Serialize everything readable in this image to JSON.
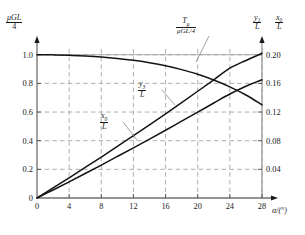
{
  "chart_data": {
    "type": "line",
    "title": "",
    "xlabel": "α/(°)",
    "ylabel_left_num": "μGL",
    "ylabel_left_den": "4",
    "ylabel_right_1_num": "y₃",
    "ylabel_right_1_den": "L",
    "ylabel_right_2_num": "x₀",
    "ylabel_right_2_den": "L",
    "xlim": [
      0,
      28
    ],
    "ylim_left": [
      0,
      1.04
    ],
    "ylim_right": [
      0,
      0.208
    ],
    "grid": true,
    "legend_position": "inline-annotations",
    "xticks": [
      0,
      4,
      8,
      12,
      16,
      20,
      24,
      28
    ],
    "xticklabels": [
      "0",
      "4",
      "8",
      "12",
      "16",
      "20",
      "24",
      "28"
    ],
    "yticks_left": [
      0,
      0.2,
      0.4,
      0.6,
      0.8,
      1.0
    ],
    "yticklabels_left": [
      "0",
      "0.2",
      "0.4",
      "0.6",
      "0.8",
      "1.0"
    ],
    "yticks_right": [
      0.04,
      0.08,
      0.12,
      0.16,
      0.2
    ],
    "yticklabels_right": [
      "0.04",
      "0.08",
      "0.12",
      "0.16",
      "0.20"
    ],
    "annotations": [
      {
        "name": "T_mu",
        "num": "T",
        "num_sub": "μ",
        "den": "μGL/4",
        "x": 19.5,
        "y_left": 1.02
      },
      {
        "name": "y3_over_L",
        "num": "y",
        "num_sub": "3",
        "den": "L",
        "x": 14.0,
        "y_left": 0.8
      },
      {
        "name": "x0_over_L",
        "num": "x",
        "num_sub": "0",
        "den": "L",
        "x": 9.0,
        "y_left": 0.52
      }
    ],
    "series": [
      {
        "name": "T_mu/(μGL/4)",
        "axis": "left",
        "color": "#141414",
        "x": [
          0,
          2,
          4,
          6,
          8,
          10,
          12,
          14,
          16,
          18,
          20,
          22,
          24,
          26,
          28
        ],
        "values": [
          1.0,
          0.999,
          0.996,
          0.991,
          0.984,
          0.974,
          0.961,
          0.944,
          0.923,
          0.896,
          0.864,
          0.824,
          0.776,
          0.719,
          0.65
        ]
      },
      {
        "name": "y₃/L",
        "axis": "right",
        "color": "#141414",
        "x": [
          0,
          2,
          4,
          6,
          8,
          10,
          12,
          14,
          16,
          18,
          20,
          22,
          24,
          26,
          28
        ],
        "values": [
          0.0,
          0.014,
          0.0282,
          0.0426,
          0.0572,
          0.072,
          0.087,
          0.1022,
          0.1176,
          0.1332,
          0.149,
          0.165,
          0.1812,
          0.192,
          0.202
        ]
      },
      {
        "name": "x₀/L",
        "axis": "right",
        "color": "#141414",
        "x": [
          0,
          2,
          4,
          6,
          8,
          10,
          12,
          14,
          16,
          18,
          20,
          22,
          24,
          26,
          28
        ],
        "values": [
          0.0,
          0.0112,
          0.0226,
          0.0342,
          0.046,
          0.058,
          0.07,
          0.0822,
          0.0946,
          0.1072,
          0.1198,
          0.1326,
          0.1452,
          0.156,
          0.165
        ]
      }
    ]
  }
}
